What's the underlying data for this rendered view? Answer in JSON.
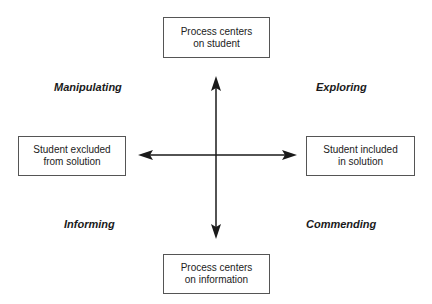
{
  "diagram": {
    "type": "quadrant",
    "axes": {
      "vertical": {
        "top": {
          "line1": "Process centers",
          "line2": "on student"
        },
        "bottom": {
          "line1": "Process centers",
          "line2": "on information"
        }
      },
      "horizontal": {
        "left": {
          "line1": "Student excluded",
          "line2": "from solution"
        },
        "right": {
          "line1": "Student included",
          "line2": "in solution"
        }
      }
    },
    "quadrants": {
      "top_left": "Manipulating",
      "top_right": "Exploring",
      "bottom_left": "Informing",
      "bottom_right": "Commending"
    },
    "colors": {
      "arrow": "#1a1a1a",
      "box_border": "#555555",
      "text": "#222222",
      "background": "#ffffff"
    }
  }
}
